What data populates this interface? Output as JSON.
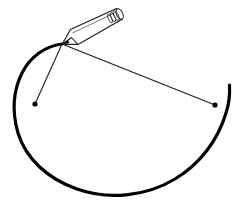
{
  "figure": {
    "title": "Pen drawing an arc with two radius lines",
    "width": 248,
    "height": 204,
    "background_color": "#ffffff",
    "ink_color": "#000000",
    "line_color": "#1a1a1a",
    "pen_body_fill": "#ffffff",
    "pen_outline_color": "#1a1a1a",
    "caption": ""
  },
  "chart_data": {
    "type": "scatter",
    "title": "Pen drawing an arc with two radius lines",
    "xlabel": "",
    "ylabel": "",
    "xlim": [
      0,
      248
    ],
    "ylim": [
      0,
      204
    ],
    "grid": false,
    "legend": "none",
    "annotations": [
      "arc drawn in heavy black ink",
      "two thin straight rays from pen tip to marked points",
      "pen shown as outlined barrel with ringed cap"
    ],
    "points": [
      {
        "name": "pen-tip",
        "x": 62,
        "y": 44
      },
      {
        "name": "left-dot",
        "x": 35,
        "y": 104
      },
      {
        "name": "right-dot",
        "x": 215,
        "y": 105
      }
    ],
    "series": [
      {
        "name": "arc",
        "kind": "open-arc",
        "stroke_width": 3,
        "path": "M 62 44 C 38 48 18 70 15 104 C 12 140 42 176 86 190 C 130 203 186 186 213 153 C 227 136 232 112 230 86"
      },
      {
        "name": "ray-to-left-dot",
        "kind": "line",
        "stroke_width": 1,
        "from": [
          62,
          44
        ],
        "to": [
          35,
          104
        ]
      },
      {
        "name": "ray-to-right-dot",
        "kind": "line",
        "stroke_width": 1,
        "from": [
          62,
          44
        ],
        "to": [
          215,
          105
        ]
      },
      {
        "name": "pen",
        "kind": "polygon",
        "stroke_width": 1,
        "tip": [
          62,
          44
        ],
        "cap": [
          122,
          14
        ],
        "barrel_width": 8,
        "cap_rings": 3
      }
    ]
  }
}
